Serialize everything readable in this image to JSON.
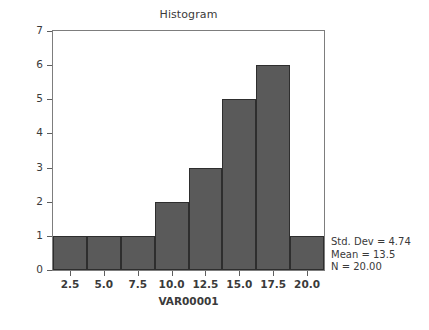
{
  "chart_data": {
    "type": "bar",
    "title": "Histogram",
    "xlabel": "VAR00001",
    "ylabel": "Frequency",
    "categories": [
      "2.5",
      "5.0",
      "7.5",
      "10.0",
      "12.5",
      "15.0",
      "17.5",
      "20.0"
    ],
    "values": [
      1,
      1,
      1,
      2,
      3,
      5,
      6,
      1
    ],
    "xticks": [
      "2.5",
      "5.0",
      "7.5",
      "10.0",
      "12.5",
      "15.0",
      "17.5",
      "20.0"
    ],
    "yticks": [
      "0",
      "1",
      "2",
      "3",
      "4",
      "5",
      "6",
      "7"
    ],
    "ylim": [
      0,
      7
    ],
    "xlim": [
      1.25,
      21.25
    ],
    "grid": false,
    "legend": false,
    "bar_color": "#5a5a5a",
    "bar_edge_color": "#2e2e2e",
    "frame_color": "#7d7d7d",
    "background": "#ffffff",
    "annotations": [
      "Std. Dev = 4.74",
      "Mean = 13.5",
      "N = 20.00"
    ]
  },
  "stats": {
    "std_dev_line": "Std. Dev = 4.74",
    "mean_line": "Mean = 13.5",
    "n_line": "N = 20.00"
  }
}
